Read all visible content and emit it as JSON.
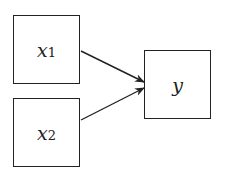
{
  "diagram": {
    "nodes": [
      {
        "id": "x1",
        "label": "x",
        "subscript": "1",
        "x": 13,
        "y": 15,
        "w": 67,
        "h": 69
      },
      {
        "id": "x2",
        "label": "x",
        "subscript": "2",
        "x": 13,
        "y": 98,
        "w": 67,
        "h": 69
      },
      {
        "id": "y",
        "label": "y",
        "subscript": "",
        "x": 144,
        "y": 50,
        "w": 67,
        "h": 69
      }
    ],
    "edges": [
      {
        "from": "x1",
        "to": "y"
      },
      {
        "from": "x2",
        "to": "y"
      }
    ],
    "colors": {
      "stroke": "#222222",
      "background": "#ffffff"
    }
  }
}
